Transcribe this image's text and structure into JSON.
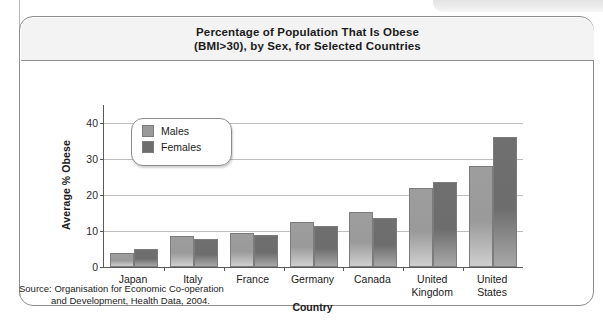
{
  "figure": {
    "title_line1": "Percentage of Population That Is Obese",
    "title_line2": "(BMI>30), by Sex, for Selected Countries",
    "source_line1": "Source: Organisation for Economic Co-operation",
    "source_line2": "and Development, Health Data, 2004."
  },
  "legend": {
    "males_label": "Males",
    "females_label": "Females"
  },
  "colors": {
    "male_bar": "#9a9a9a",
    "female_bar": "#6d6d6d",
    "frame": "#8d8d8d",
    "gridline": "#bdbdbd",
    "axis": "#5a5a5a",
    "title_band": "#f3f3f3"
  },
  "chart_data": {
    "type": "bar",
    "title": "Percentage of Population That Is Obese (BMI>30), by Sex, for Selected Countries",
    "xlabel": "Country",
    "ylabel": "Average % Obese",
    "categories": [
      "Japan",
      "Italy",
      "France",
      "Germany",
      "Canada",
      "United Kingdom",
      "United States"
    ],
    "category_lines": [
      [
        "Japan"
      ],
      [
        "Italy"
      ],
      [
        "France"
      ],
      [
        "Germany"
      ],
      [
        "Canada"
      ],
      [
        "United",
        "Kingdom"
      ],
      [
        "United",
        "States"
      ]
    ],
    "series": [
      {
        "name": "Males",
        "values": [
          4.0,
          8.6,
          9.5,
          12.5,
          15.3,
          22.0,
          28.0
        ]
      },
      {
        "name": "Females",
        "values": [
          5.0,
          7.7,
          8.8,
          11.3,
          13.5,
          23.5,
          36.0
        ]
      }
    ],
    "ylim": [
      0,
      45
    ],
    "yticks": [
      0,
      10,
      20,
      30,
      40
    ],
    "ytick_labels": [
      "0",
      "10",
      "20",
      "30",
      "40"
    ],
    "grid": true,
    "legend_position": "upper-left-inside"
  }
}
